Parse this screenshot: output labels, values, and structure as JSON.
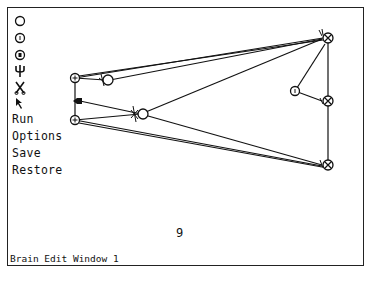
{
  "window": {
    "title": "Brain Edit Window 1",
    "counter": "9"
  },
  "tools": [
    {
      "name": "neuron-tool",
      "icon": "empty-circle-icon"
    },
    {
      "name": "excitatory-neuron-tool",
      "icon": "circle-dot-icon"
    },
    {
      "name": "inhibitory-neuron-tool",
      "icon": "circle-bar-icon"
    },
    {
      "name": "sensor-tool",
      "icon": "trident-icon"
    },
    {
      "name": "cut-tool",
      "icon": "scissors-icon"
    },
    {
      "name": "select-tool",
      "icon": "arrow-pointer-icon"
    }
  ],
  "menu": {
    "run": "Run",
    "options": "Options",
    "save": "Save",
    "restore": "Restore"
  },
  "colors": {
    "ink": "#111111",
    "background": "#ffffff"
  }
}
